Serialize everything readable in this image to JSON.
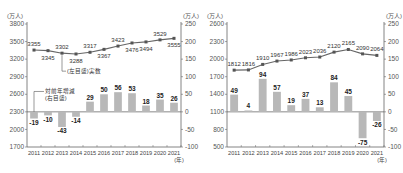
{
  "chart_data": [
    {
      "type": "bar+line",
      "title": "",
      "categories": [
        "2011",
        "2012",
        "2013",
        "2014",
        "2015",
        "2016",
        "2017",
        "2018",
        "2019",
        "2020",
        "2021"
      ],
      "x_unit_label": "(年)",
      "left_axis": {
        "unit": "(万人)",
        "ticks": [
          3800,
          3500,
          3200,
          2900,
          2600,
          2300,
          2000,
          1700
        ],
        "range": [
          1700,
          3800
        ]
      },
      "right_axis": {
        "unit": "(万人)",
        "ticks": [
          250,
          200,
          150,
          100,
          50,
          0,
          -50,
          -100
        ],
        "range": [
          -100,
          250
        ]
      },
      "series": [
        {
          "name": "(左目盛)実数",
          "kind": "line",
          "axis": "left",
          "color": "#666666",
          "values": [
            3355,
            3345,
            3302,
            3288,
            3317,
            3367,
            3423,
            3476,
            3494,
            3529,
            3555
          ]
        },
        {
          "name": "対前年増減(右目盛)",
          "kind": "bar",
          "axis": "right",
          "color": "#b8b8b8",
          "values": [
            -19,
            -10,
            -43,
            -14,
            29,
            50,
            56,
            53,
            18,
            35,
            26
          ]
        }
      ],
      "legend": [
        {
          "text": "(左目盛)実数",
          "series": 0
        },
        {
          "text_line1": "対前年増減",
          "text_line2": "(右目盛)",
          "series": 1
        }
      ],
      "grid": false
    },
    {
      "type": "bar+line",
      "title": "",
      "categories": [
        "2011",
        "2012",
        "2013",
        "2014",
        "2015",
        "2016",
        "2017",
        "2018",
        "2019",
        "2020",
        "2021"
      ],
      "x_unit_label": "(年)",
      "left_axis": {
        "unit": "(万人)",
        "ticks": [
          2600,
          2300,
          2000,
          1700,
          1400,
          1100,
          800,
          500
        ],
        "range": [
          500,
          2600
        ]
      },
      "right_axis": {
        "unit": "(万人)",
        "ticks": [
          250,
          200,
          150,
          100,
          50,
          0,
          -50,
          -100
        ],
        "range": [
          -100,
          250
        ]
      },
      "series": [
        {
          "name": "実数",
          "kind": "line",
          "axis": "left",
          "color": "#666666",
          "values": [
            1812,
            1816,
            1910,
            1967,
            1986,
            2023,
            2036,
            2120,
            2165,
            2090,
            2064
          ]
        },
        {
          "name": "対前年増減",
          "kind": "bar",
          "axis": "right",
          "color": "#b8b8b8",
          "values": [
            49,
            4,
            94,
            57,
            19,
            37,
            13,
            84,
            45,
            -75,
            -26
          ]
        }
      ],
      "grid": false
    }
  ]
}
